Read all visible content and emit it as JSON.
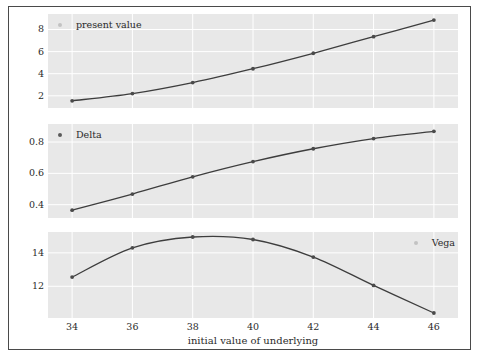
{
  "figure": {
    "xlabel": "initial value of underlying",
    "xticks": [
      "34",
      "36",
      "38",
      "40",
      "42",
      "44",
      "46"
    ],
    "colors": {
      "plot_background": "#e8e8e8",
      "gridline": "#ffffff",
      "series": "#3d3d3d",
      "frame": "#4a4a4a",
      "text": "#2b2b2b"
    }
  },
  "panels": {
    "present_value": {
      "legend": "present value",
      "yticks": [
        "2",
        "4",
        "6",
        "8"
      ]
    },
    "delta": {
      "legend": "Delta",
      "yticks": [
        "0.4",
        "0.6",
        "0.8"
      ]
    },
    "vega": {
      "legend": "Vega",
      "yticks": [
        "12",
        "14"
      ]
    }
  },
  "chart_data": [
    {
      "type": "line",
      "title": "",
      "name": "present value",
      "xlabel": "initial value of underlying",
      "ylabel": "",
      "x": [
        34,
        36,
        38,
        40,
        42,
        44,
        46
      ],
      "values": [
        1.55,
        2.2,
        3.2,
        4.45,
        5.85,
        7.35,
        8.85
      ],
      "xlim": [
        33.2,
        46.8
      ],
      "ylim": [
        0.9,
        9.4
      ],
      "yticks": [
        2,
        4,
        6,
        8
      ],
      "xticks": [
        34,
        36,
        38,
        40,
        42,
        44,
        46
      ],
      "grid": true,
      "legend": "present value",
      "legend_position": "top-left",
      "markers": true
    },
    {
      "type": "line",
      "title": "",
      "name": "Delta",
      "xlabel": "initial value of underlying",
      "ylabel": "",
      "x": [
        34,
        36,
        38,
        40,
        42,
        44,
        46
      ],
      "values": [
        0.365,
        0.468,
        0.578,
        0.675,
        0.757,
        0.822,
        0.868
      ],
      "xlim": [
        33.2,
        46.8
      ],
      "ylim": [
        0.315,
        0.915
      ],
      "yticks": [
        0.4,
        0.6,
        0.8
      ],
      "xticks": [
        34,
        36,
        38,
        40,
        42,
        44,
        46
      ],
      "grid": true,
      "legend": "Delta",
      "legend_position": "top-left",
      "markers": true
    },
    {
      "type": "line",
      "title": "",
      "name": "Vega",
      "xlabel": "initial value of underlying",
      "ylabel": "",
      "x": [
        34,
        36,
        38,
        40,
        42,
        44,
        46
      ],
      "values": [
        12.55,
        14.3,
        14.95,
        14.8,
        13.75,
        12.05,
        10.4
      ],
      "xlim": [
        33.2,
        46.8
      ],
      "ylim": [
        10.1,
        15.25
      ],
      "yticks": [
        12,
        14
      ],
      "xticks": [
        34,
        36,
        38,
        40,
        42,
        44,
        46
      ],
      "grid": true,
      "legend": "Vega",
      "legend_position": "top-right",
      "markers": true
    }
  ]
}
